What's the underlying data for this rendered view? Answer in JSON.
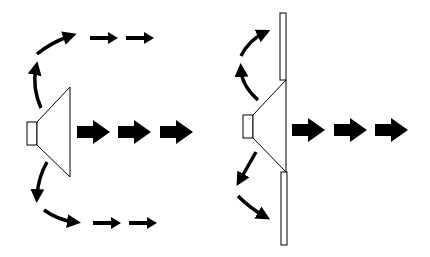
{
  "diagram": {
    "colors": {
      "stroke": "#000000",
      "fill_arrow": "#000000",
      "background": "#ffffff"
    },
    "panels": [
      {
        "name": "speaker-without-baffle",
        "description": "Sound radiates forward and wraps around the sides/back"
      },
      {
        "name": "speaker-with-baffle",
        "description": "Baffle blocks rear/side waves; sound projects forward"
      }
    ]
  }
}
